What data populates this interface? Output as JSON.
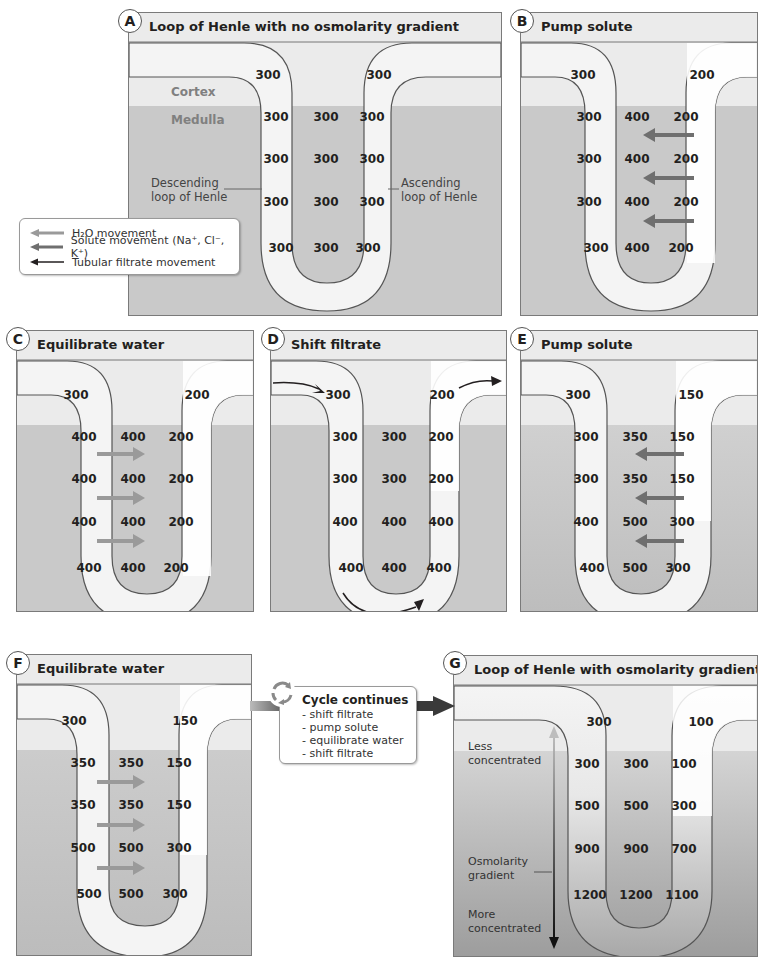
{
  "legend": {
    "items": [
      {
        "label": "H₂O movement",
        "icon": "h2o-arrow-icon",
        "color": "#9a9a9a"
      },
      {
        "label": "Solute movement (Na⁺, Cl⁻, K⁺)",
        "icon": "solute-arrow-icon",
        "color": "#6f6f6f"
      },
      {
        "label": "Tubular filtrate movement",
        "icon": "filtrate-arrow-icon",
        "color": "#231f20"
      }
    ]
  },
  "colors": {
    "cortex": "#ebebeb",
    "medulla": "#c9c9c9",
    "tubule": "#f5f5f5",
    "h2o_arrow": "#9a9a9a",
    "solute_arrow": "#6f6f6f",
    "filtrate_arrow": "#231f20"
  },
  "panels": {
    "A": {
      "badge": "A",
      "title": "Loop of Henle with no osmolarity gradient",
      "zones": {
        "cortex": "Cortex",
        "medulla": "Medulla"
      },
      "annotations": {
        "descending": "Descending\nloop of Henle",
        "ascending": "Ascending\nloop of Henle"
      },
      "top": {
        "descending": "300",
        "ascending": "300"
      },
      "rows": [
        {
          "descending": "300",
          "interstitial": "300",
          "ascending": "300"
        },
        {
          "descending": "300",
          "interstitial": "300",
          "ascending": "300"
        },
        {
          "descending": "300",
          "interstitial": "300",
          "ascending": "300"
        },
        {
          "descending": "300",
          "interstitial": "300",
          "ascending": "300"
        }
      ]
    },
    "B": {
      "badge": "B",
      "title": "Pump solute",
      "top": {
        "descending": "300",
        "ascending": "200"
      },
      "rows": [
        {
          "descending": "300",
          "interstitial": "400",
          "ascending": "200"
        },
        {
          "descending": "300",
          "interstitial": "400",
          "ascending": "200"
        },
        {
          "descending": "300",
          "interstitial": "400",
          "ascending": "200"
        },
        {
          "descending": "300",
          "interstitial": "400",
          "ascending": "200"
        }
      ],
      "arrows": "solute"
    },
    "C": {
      "badge": "C",
      "title": "Equilibrate water",
      "top": {
        "descending": "300",
        "ascending": "200"
      },
      "rows": [
        {
          "descending": "400",
          "interstitial": "400",
          "ascending": "200"
        },
        {
          "descending": "400",
          "interstitial": "400",
          "ascending": "200"
        },
        {
          "descending": "400",
          "interstitial": "400",
          "ascending": "200"
        },
        {
          "descending": "400",
          "interstitial": "400",
          "ascending": "200"
        }
      ],
      "arrows": "h2o"
    },
    "D": {
      "badge": "D",
      "title": "Shift filtrate",
      "top": {
        "descending": "300",
        "ascending": "200"
      },
      "rows": [
        {
          "descending": "300",
          "interstitial": "300",
          "ascending": "200"
        },
        {
          "descending": "300",
          "interstitial": "300",
          "ascending": "200"
        },
        {
          "descending": "400",
          "interstitial": "400",
          "ascending": "400"
        },
        {
          "descending": "400",
          "interstitial": "400",
          "ascending": "400"
        }
      ],
      "arrows": "filtrate"
    },
    "E": {
      "badge": "E",
      "title": "Pump solute",
      "top": {
        "descending": "300",
        "ascending": "150"
      },
      "rows": [
        {
          "descending": "300",
          "interstitial": "350",
          "ascending": "150"
        },
        {
          "descending": "300",
          "interstitial": "350",
          "ascending": "150"
        },
        {
          "descending": "400",
          "interstitial": "500",
          "ascending": "300"
        },
        {
          "descending": "400",
          "interstitial": "500",
          "ascending": "300"
        }
      ],
      "arrows": "solute"
    },
    "F": {
      "badge": "F",
      "title": "Equilibrate water",
      "top": {
        "descending": "300",
        "ascending": "150"
      },
      "rows": [
        {
          "descending": "350",
          "interstitial": "350",
          "ascending": "150"
        },
        {
          "descending": "350",
          "interstitial": "350",
          "ascending": "150"
        },
        {
          "descending": "500",
          "interstitial": "500",
          "ascending": "300"
        },
        {
          "descending": "500",
          "interstitial": "500",
          "ascending": "300"
        }
      ],
      "arrows": "h2o"
    },
    "G": {
      "badge": "G",
      "title": "Loop of Henle with osmolarity gradient",
      "annotations": {
        "less": "Less\nconcentrated",
        "gradient": "Osmolarity\ngradient",
        "more": "More\nconcentrated"
      },
      "top": {
        "descending": "300",
        "ascending": "100"
      },
      "rows": [
        {
          "descending": "300",
          "interstitial": "300",
          "ascending": "100"
        },
        {
          "descending": "500",
          "interstitial": "500",
          "ascending": "300"
        },
        {
          "descending": "900",
          "interstitial": "900",
          "ascending": "700"
        },
        {
          "descending": "1200",
          "interstitial": "1200",
          "ascending": "1100"
        }
      ]
    }
  },
  "cycle": {
    "title": "Cycle continues",
    "icon": "cycle-arrows-icon",
    "steps": [
      "- shift filtrate",
      "- pump solute",
      "- equilibrate water",
      "- shift filtrate"
    ]
  }
}
